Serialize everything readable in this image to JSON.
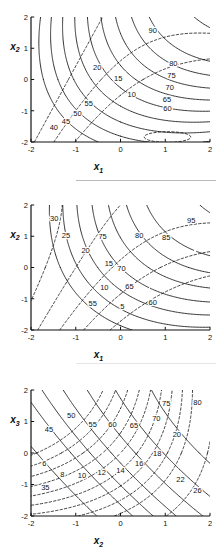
{
  "figure": {
    "type": "contour-plot-series",
    "panel_count": 3,
    "background": "#ffffff",
    "line_color": "#111111"
  },
  "chart_data": [
    {
      "id": "panel-1",
      "type": "line",
      "title": "",
      "xlabel": "x1",
      "ylabel": "x2",
      "xlabel_base": "x",
      "xlabel_sub": "1",
      "ylabel_base": "x",
      "ylabel_sub": "2",
      "xlim": [
        -2,
        2
      ],
      "ylim": [
        -2,
        2
      ],
      "xticks": [
        "-2",
        "-1",
        "0",
        "1",
        "2"
      ],
      "xtick_values": [
        -2,
        -1,
        0,
        1,
        2
      ],
      "yticks": [
        "-2",
        "-1",
        "0",
        "1",
        "2"
      ],
      "ytick_values": [
        -2,
        -1,
        0,
        1,
        2
      ],
      "grid": false,
      "legend": "none",
      "series": [
        {
          "name": "objective-contours",
          "style": "solid",
          "levels": [
            40,
            45,
            50,
            55,
            60,
            65,
            70,
            75,
            80,
            90
          ],
          "labels": [
            "40",
            "45",
            "50",
            "55",
            "60",
            "65",
            "70",
            "75",
            "80",
            "90"
          ],
          "label_points": [
            {
              "value": "40",
              "x": -1.49,
              "y": -1.62
            },
            {
              "value": "45",
              "x": -1.22,
              "y": -1.42
            },
            {
              "value": "50",
              "x": -0.96,
              "y": -1.17
            },
            {
              "value": "55",
              "x": -0.71,
              "y": -0.86
            },
            {
              "value": "60",
              "x": 1.05,
              "y": -1.02
            },
            {
              "value": "65",
              "x": 1.04,
              "y": -0.72
            },
            {
              "value": "70",
              "x": 1.1,
              "y": -0.32
            },
            {
              "value": "75",
              "x": 1.14,
              "y": 0.04
            },
            {
              "value": "80",
              "x": 1.18,
              "y": 0.42
            },
            {
              "value": "90",
              "x": 0.72,
              "y": 1.48
            }
          ]
        },
        {
          "name": "constraint-contours",
          "style": "dashed",
          "levels": [
            10,
            15,
            20
          ],
          "labels": [
            "10",
            "15",
            "20"
          ],
          "label_points": [
            {
              "value": "10",
              "x": 0.25,
              "y": -0.56
            },
            {
              "value": "15",
              "x": -0.05,
              "y": -0.06
            },
            {
              "value": "20",
              "x": -0.52,
              "y": 0.3
            }
          ]
        }
      ]
    },
    {
      "id": "panel-2",
      "type": "line",
      "title": "",
      "xlabel": "x1",
      "ylabel": "x2",
      "xlabel_base": "x",
      "xlabel_sub": "1",
      "ylabel_base": "x",
      "ylabel_sub": "2",
      "xlim": [
        -2,
        2
      ],
      "ylim": [
        -2,
        2
      ],
      "xticks": [
        "-2",
        "-1",
        "0",
        "1",
        "2"
      ],
      "xtick_values": [
        -2,
        -1,
        0,
        1,
        2
      ],
      "yticks": [
        "-2",
        "-1",
        "0",
        "1",
        "2"
      ],
      "ytick_values": [
        -2,
        -1,
        0,
        1,
        2
      ],
      "grid": false,
      "legend": "none",
      "series": [
        {
          "name": "objective-contours",
          "style": "solid",
          "levels": [
            55,
            60,
            65,
            70,
            75,
            80,
            85,
            95
          ],
          "labels": [
            "55",
            "60",
            "65",
            "70",
            "75",
            "80",
            "85",
            "95"
          ],
          "label_points": [
            {
              "value": "55",
              "x": -0.62,
              "y": -1.22
            },
            {
              "value": "60",
              "x": 0.72,
              "y": -1.2
            },
            {
              "value": "65",
              "x": 0.2,
              "y": -0.68
            },
            {
              "value": "70",
              "x": 0.02,
              "y": -0.1
            },
            {
              "value": "75",
              "x": -0.4,
              "y": 0.9
            },
            {
              "value": "80",
              "x": 0.42,
              "y": 0.94
            },
            {
              "value": "85",
              "x": 1.02,
              "y": 0.88
            },
            {
              "value": "95",
              "x": 1.58,
              "y": 1.42
            }
          ]
        },
        {
          "name": "constraint-contours",
          "style": "dashed",
          "levels": [
            5,
            10,
            15,
            20,
            25,
            30
          ],
          "labels": [
            "5",
            "10",
            "15",
            "20",
            "25",
            "30"
          ],
          "label_points": [
            {
              "value": "5",
              "x": 0.04,
              "y": -1.32
            },
            {
              "value": "10",
              "x": -0.36,
              "y": -0.72
            },
            {
              "value": "15",
              "x": -0.26,
              "y": 0.06
            },
            {
              "value": "20",
              "x": -0.78,
              "y": 0.46
            },
            {
              "value": "25",
              "x": -1.22,
              "y": 0.96
            },
            {
              "value": "30",
              "x": -1.48,
              "y": 1.48
            }
          ]
        }
      ]
    },
    {
      "id": "panel-3",
      "type": "line",
      "title": "",
      "xlabel": "x2",
      "ylabel": "x3",
      "xlabel_base": "x",
      "xlabel_sub": "2",
      "ylabel_base": "x",
      "ylabel_sub": "3",
      "xlim": [
        -2,
        2
      ],
      "ylim": [
        -2,
        2
      ],
      "xticks": [
        "-2",
        "-1",
        "0",
        "1",
        "2"
      ],
      "xtick_values": [
        -2,
        -1,
        0,
        1,
        2
      ],
      "yticks": [
        "-2",
        "-1",
        "0",
        "1",
        "2"
      ],
      "ytick_values": [
        -2,
        -1,
        0,
        1,
        2
      ],
      "grid": false,
      "legend": "none",
      "series": [
        {
          "name": "objective-contours",
          "style": "solid",
          "levels": [
            35,
            45,
            50,
            55,
            60,
            65,
            70,
            75,
            80
          ],
          "labels": [
            "35",
            "45",
            "50",
            "55",
            "60",
            "65",
            "70",
            "75",
            "80"
          ],
          "label_points": [
            {
              "value": "35",
              "x": -1.68,
              "y": -1.18
            },
            {
              "value": "45",
              "x": -1.6,
              "y": 0.66
            },
            {
              "value": "50",
              "x": -1.1,
              "y": 1.1
            },
            {
              "value": "55",
              "x": -0.62,
              "y": 0.82
            },
            {
              "value": "60",
              "x": -0.18,
              "y": 0.82
            },
            {
              "value": "65",
              "x": 0.3,
              "y": 0.78
            },
            {
              "value": "70",
              "x": 0.8,
              "y": 1.02
            },
            {
              "value": "75",
              "x": 1.02,
              "y": 1.5
            },
            {
              "value": "80",
              "x": 1.72,
              "y": 1.52
            }
          ]
        },
        {
          "name": "constraint-contours",
          "style": "dashed",
          "levels": [
            6,
            8,
            10,
            12,
            14,
            16,
            18,
            20,
            22,
            26
          ],
          "labels": [
            "6",
            "8",
            "10",
            "12",
            "14",
            "16",
            "18",
            "20",
            "22",
            "26"
          ],
          "label_points": [
            {
              "value": "6",
              "x": -1.7,
              "y": -0.42
            },
            {
              "value": "8",
              "x": -1.3,
              "y": -0.76
            },
            {
              "value": "10",
              "x": -0.86,
              "y": -0.78
            },
            {
              "value": "12",
              "x": -0.42,
              "y": -0.7
            },
            {
              "value": "14",
              "x": 0.0,
              "y": -0.62
            },
            {
              "value": "16",
              "x": 0.42,
              "y": -0.42
            },
            {
              "value": "18",
              "x": 0.82,
              "y": -0.1
            },
            {
              "value": "20",
              "x": 1.26,
              "y": 0.52
            },
            {
              "value": "22",
              "x": 1.34,
              "y": -0.92
            },
            {
              "value": "26",
              "x": 1.72,
              "y": -1.28
            }
          ]
        }
      ]
    }
  ]
}
